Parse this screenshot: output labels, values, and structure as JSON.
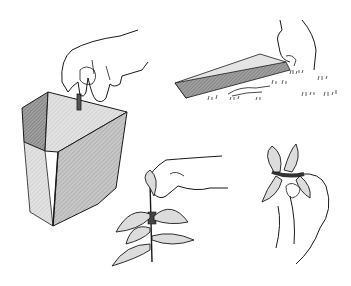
{
  "illustration": {
    "description": "Line-drawing illustration of four steps: pushing a cutting into a rooting-medium block, pressing a strip into soil, and two hands holding leafy stem cuttings tied at the node",
    "panels": [
      {
        "id": "block",
        "label": "Hand inserting cutting into rooting block"
      },
      {
        "id": "soil",
        "label": "Hand pressing strip into ground"
      },
      {
        "id": "cutting-left",
        "label": "Hand holding leafy cutting"
      },
      {
        "id": "cutting-right",
        "label": "Hand holding tied cutting"
      }
    ],
    "colors": {
      "ink": "#1a1a1a",
      "shade_dark": "#8a8a8a",
      "shade_mid": "#a8a8a8",
      "shade_light": "#d6d6d6",
      "leaf_fill": "#dcdcdc",
      "background": "#ffffff"
    }
  }
}
